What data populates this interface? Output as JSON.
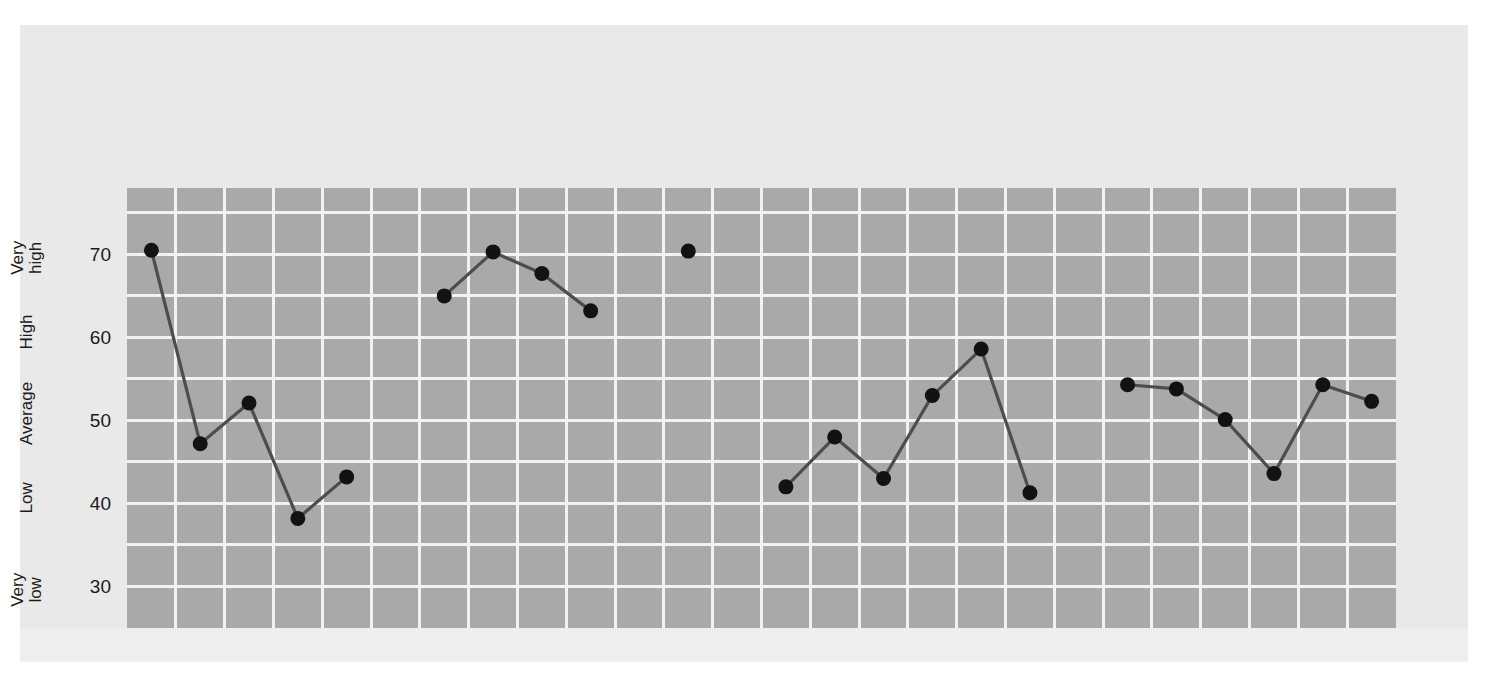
{
  "chart_data": {
    "type": "line",
    "title": "",
    "xlabel": "",
    "ylabel": "",
    "ylim": [
      25,
      78
    ],
    "yticks": [
      30,
      40,
      50,
      60,
      70
    ],
    "ytick_labels": [
      "30",
      "40",
      "50",
      "60",
      "70"
    ],
    "band_labels": [
      "Very high",
      "High",
      "Average",
      "Low",
      "Very low"
    ],
    "grid": true,
    "legend_position": "none",
    "categories": [
      "Neuroticism (N)",
      "Extraversion (E)",
      "Openness (O)",
      "Agreeableness (A)",
      "Conscientiousnes (C)",
      "Anxiety (N1)",
      "Hostility (N2)",
      "Depression (N3)",
      "Self-consciousness (N4)",
      "Impulsiveness (N5)",
      "Vulnerability (N6)",
      "Warmth (E1)",
      "Gregariousness (E2)",
      "Assertiveness (E3)",
      "Activity (E4)",
      "Excitement-seeking (E5)",
      "Positive emotions (E6)",
      "Fantasy (O1)",
      "Aesthetics (O2)",
      "Feelings (O3)",
      "Actions (O4)",
      "Ideas (O5)",
      "Values (O6)"
    ],
    "values": [
      70.5,
      47.2,
      52.1,
      38.2,
      43.2,
      65.0,
      70.3,
      67.7,
      63.2,
      null,
      70.4,
      42.0,
      48.0,
      43.0,
      53.0,
      58.6,
      41.3,
      54.3,
      53.8,
      50.1,
      43.6,
      54.3,
      52.3
    ],
    "groups": [
      {
        "name": "Domains",
        "bold": true,
        "start": 0,
        "count": 5
      },
      {
        "name": "Neuroticism facets",
        "bold": false,
        "start": 5,
        "count": 6
      },
      {
        "name": "Extraversion facets",
        "bold": false,
        "start": 11,
        "count": 6
      },
      {
        "name": "Openness facets",
        "bold": false,
        "start": 17,
        "count": 6
      }
    ],
    "colors": {
      "plot_background": "#a9a9a9",
      "gridline": "#f2f2f2",
      "line": "#4d4d4d",
      "marker": "#121212",
      "page_background": "#e9e9e9",
      "text": "#141414"
    }
  }
}
